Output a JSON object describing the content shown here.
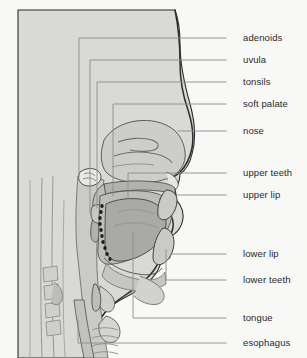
{
  "colors": {
    "background": "#f8f8f6",
    "skin_tissue": "#d8d8d4",
    "cavity_lining": "#b9b9b5",
    "tongue": "#a8a8a4",
    "soft_tissue_mid": "#c6c6c2",
    "outline_dark": "#2d2d2d",
    "outline_light": "#8d8d8a",
    "leader_line": "#8d8d8a",
    "teeth_white": "#fafafa",
    "text": "#2b2b2b"
  },
  "labels": [
    {
      "id": "adenoids",
      "text": "adenoids",
      "text_x": 243,
      "text_y": 38,
      "tick_x1": 226,
      "tick_x2": 240,
      "tick_y": 38,
      "leader_corner_x": 79,
      "leader_end_y": 178
    },
    {
      "id": "uvula",
      "text": "uvula",
      "text_x": 243,
      "text_y": 60,
      "tick_x1": 226,
      "tick_x2": 240,
      "tick_y": 60,
      "leader_corner_x": 90,
      "leader_end_y": 195
    },
    {
      "id": "tonsils",
      "text": "tonsils",
      "text_x": 243,
      "text_y": 82,
      "tick_x1": 226,
      "tick_x2": 240,
      "tick_y": 82,
      "leader_corner_x": 97,
      "leader_end_y": 212
    },
    {
      "id": "soft-palate",
      "text": "soft palate",
      "text_x": 243,
      "text_y": 104,
      "tick_x1": 226,
      "tick_x2": 240,
      "tick_y": 104,
      "leader_corner_x": 113,
      "leader_end_y": 167
    },
    {
      "id": "nose",
      "text": "nose",
      "text_x": 243,
      "text_y": 131,
      "tick_x1": 226,
      "tick_x2": 240,
      "tick_y": 131,
      "leader_corner_x": 0,
      "leader_end_y": 0
    },
    {
      "id": "upper-teeth",
      "text": "upper teeth",
      "text_x": 243,
      "text_y": 173,
      "tick_x1": 226,
      "tick_x2": 240,
      "tick_y": 173,
      "leader_corner_x": 0,
      "leader_end_y": 0
    },
    {
      "id": "upper-lip",
      "text": "upper lip",
      "text_x": 243,
      "text_y": 195,
      "tick_x1": 226,
      "tick_x2": 240,
      "tick_y": 195,
      "leader_corner_x": 0,
      "leader_end_y": 0
    },
    {
      "id": "lower-lip",
      "text": "lower lip",
      "text_x": 243,
      "text_y": 254,
      "tick_x1": 226,
      "tick_x2": 240,
      "tick_y": 254,
      "leader_corner_x": 0,
      "leader_end_y": 0
    },
    {
      "id": "lower-teeth",
      "text": "lower teeth",
      "text_x": 243,
      "text_y": 280,
      "tick_x1": 226,
      "tick_x2": 240,
      "tick_y": 280,
      "leader_corner_x": 0,
      "leader_end_y": 0
    },
    {
      "id": "tongue",
      "text": "tongue",
      "text_x": 243,
      "text_y": 318,
      "tick_x1": 226,
      "tick_x2": 240,
      "tick_y": 318,
      "leader_corner_x": 0,
      "leader_end_y": 0
    },
    {
      "id": "esophagus",
      "text": "esophagus",
      "text_x": 243,
      "text_y": 343,
      "tick_x1": 226,
      "tick_x2": 240,
      "tick_y": 343,
      "leader_corner_x": 0,
      "leader_end_y": 0
    }
  ]
}
